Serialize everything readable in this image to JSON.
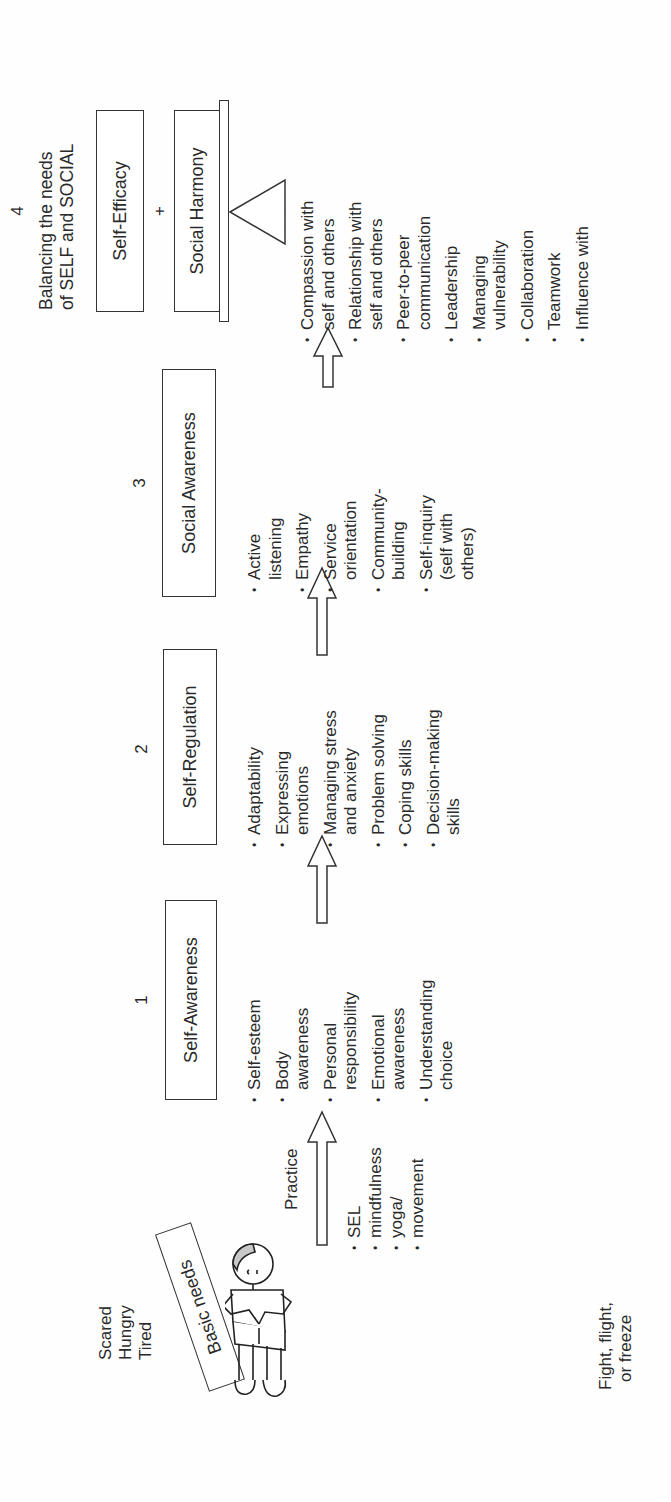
{
  "orientation": "rotated-90-ccw",
  "start": {
    "feelings": [
      "Scared",
      "Hungry",
      "Tired"
    ],
    "basic_needs_label": "Basic needs",
    "reaction": [
      "Fight, flight,",
      "or freeze"
    ],
    "figure_icon": "child-figure-icon"
  },
  "practice": {
    "label": "Practice",
    "items": [
      "SEL",
      "mindfulness",
      "yoga/",
      "movement"
    ]
  },
  "stages": [
    {
      "number": "1",
      "title": "Self-Awareness",
      "items": [
        "Self-esteem",
        "Body\nawareness",
        "Personal\nresponsibility",
        "Emotional\nawareness",
        "Understanding\nchoice"
      ]
    },
    {
      "number": "2",
      "title": "Self-Regulation",
      "items": [
        "Adaptability",
        "Expressing\nemotions",
        "Managing stress\nand anxiety",
        "Problem solving",
        "Coping skills",
        "Decision-making\nskills"
      ]
    },
    {
      "number": "3",
      "title": "Social Awareness",
      "items": [
        "Active\nlistening",
        "Empathy",
        "Service\norientation",
        "Community-\nbuilding",
        "Self-inquiry\n(self with\nothers)"
      ]
    },
    {
      "number": "4",
      "heading": [
        "Balancing the needs",
        "of SELF and SOCIAL"
      ],
      "box_top": "Self-Efficacy",
      "plus": "+",
      "box_bottom": "Social Harmony",
      "items": [
        "Compassion with\nself and others",
        "Relationship with\nself and others",
        "Peer-to-peer\ncommunication",
        "Leadership",
        "Managing\nvulnerability",
        "Collaboration",
        "Teamwork",
        "Influence with"
      ]
    }
  ]
}
